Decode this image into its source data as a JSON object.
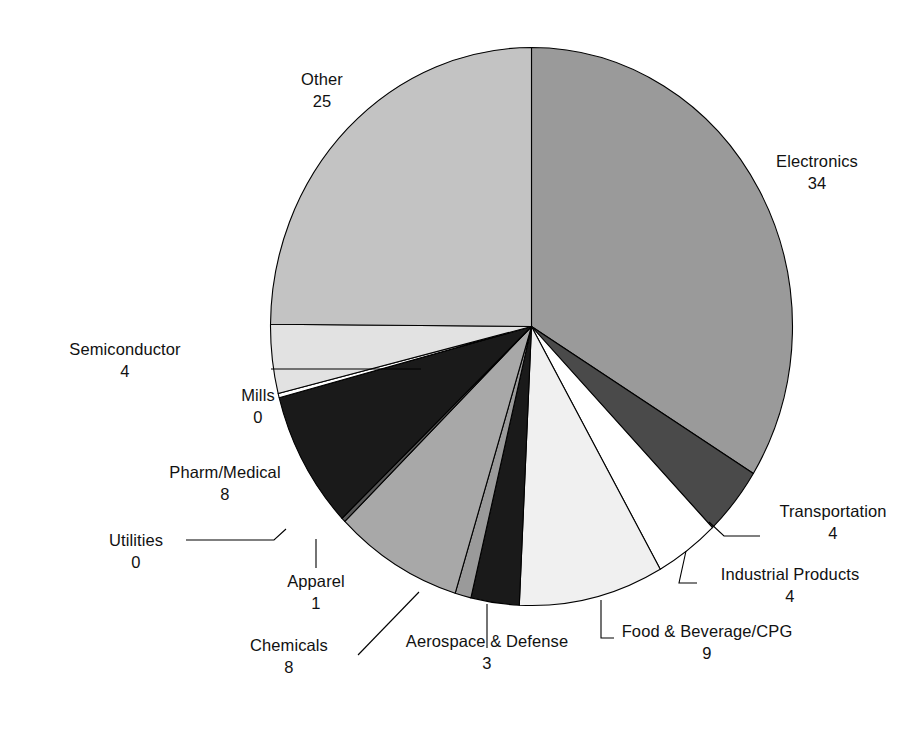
{
  "chart_data": {
    "type": "pie",
    "title": "",
    "subtitle": "",
    "xlabel": "",
    "ylabel": "",
    "legend_position": "none",
    "grid": false,
    "total": 100,
    "start_angle_deg": 0,
    "direction": "clockwise",
    "label_format": "name over value",
    "categories": [
      "Electronics",
      "Transportation",
      "Industrial Products",
      "Food & Beverage/CPG",
      "Aerospace & Defense",
      "Apparel",
      "Chemicals",
      "Utilities",
      "Pharm/Medical",
      "Mills",
      "Semiconductor",
      "Other"
    ],
    "values": [
      34,
      4,
      4,
      9,
      3,
      1,
      8,
      0,
      8,
      0,
      4,
      25
    ],
    "slices": [
      {
        "name": "Electronics",
        "value": 34,
        "color": "#9a9a9a"
      },
      {
        "name": "Transportation",
        "value": 4,
        "color": "#4a4a4a"
      },
      {
        "name": "Industrial Products",
        "value": 4,
        "color": "#ffffff"
      },
      {
        "name": "Food & Beverage/CPG",
        "value": 9,
        "color": "#f0f0f0"
      },
      {
        "name": "Aerospace & Defense",
        "value": 3,
        "color": "#1a1a1a"
      },
      {
        "name": "Apparel",
        "value": 1,
        "color": "#9a9a9a"
      },
      {
        "name": "Chemicals",
        "value": 8,
        "color": "#a8a8a8"
      },
      {
        "name": "Utilities",
        "value": 0,
        "color": "#585858"
      },
      {
        "name": "Pharm/Medical",
        "value": 8,
        "color": "#1a1a1a"
      },
      {
        "name": "Mills",
        "value": 0,
        "color": "#ffffff"
      },
      {
        "name": "Semiconductor",
        "value": 4,
        "color": "#e2e2e2"
      },
      {
        "name": "Other",
        "value": 25,
        "color": "#c3c3c3"
      }
    ]
  },
  "labels": {
    "electronics": {
      "name": "Electronics",
      "value": "34"
    },
    "transportation": {
      "name": "Transportation",
      "value": "4"
    },
    "industrial": {
      "name": "Industrial Products",
      "value": "4"
    },
    "food": {
      "name": "Food & Beverage/CPG",
      "value": "9"
    },
    "aerospace": {
      "name": "Aerospace & Defense",
      "value": "3"
    },
    "apparel": {
      "name": "Apparel",
      "value": "1"
    },
    "chemicals": {
      "name": "Chemicals",
      "value": "8"
    },
    "utilities": {
      "name": "Utilities",
      "value": "0"
    },
    "pharm": {
      "name": "Pharm/Medical",
      "value": "8"
    },
    "mills": {
      "name": "Mills",
      "value": "0"
    },
    "semiconductor": {
      "name": "Semiconductor",
      "value": "4"
    },
    "other": {
      "name": "Other",
      "value": "25"
    }
  }
}
